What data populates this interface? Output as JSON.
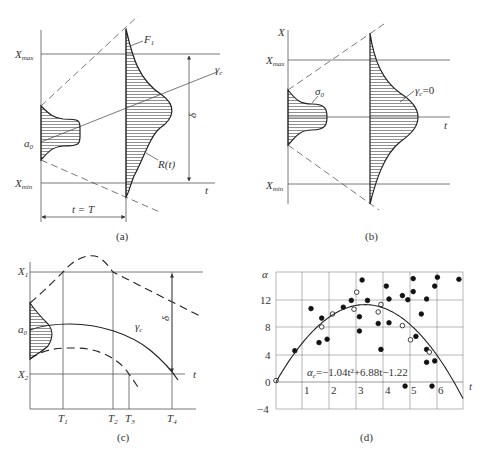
{
  "figure": {
    "panels": [
      {
        "id": "a",
        "caption": "(a)",
        "labels": {
          "x_max": "X",
          "x_max_sub": "max",
          "x_min": "X",
          "x_min_sub": "min",
          "a0": "a",
          "a0_sub": "0",
          "f1": "F",
          "f1_sub": "1",
          "gamma_c": "γ",
          "gamma_c_sub": "c",
          "r_t": "R(t)",
          "delta": "δ",
          "t_axis": "t",
          "interval": "t = T"
        }
      },
      {
        "id": "b",
        "caption": "(b)",
        "labels": {
          "x_axis": "X",
          "x_max": "X",
          "x_max_sub": "max",
          "x_min": "X",
          "x_min_sub": "min",
          "sigma0": "σ",
          "sigma0_sub": "0",
          "gamma_c": "γ",
          "gamma_c_sub": "c",
          "gamma_c_value": "=0",
          "t_axis": "t"
        }
      },
      {
        "id": "c",
        "caption": "(c)",
        "labels": {
          "x1": "X",
          "x1_sub": "1",
          "x2": "X",
          "x2_sub": "2",
          "a0": "a",
          "a0_sub": "0",
          "gamma_c": "γ",
          "gamma_c_sub": "c",
          "delta": "δ",
          "t_axis": "t",
          "t1": "T",
          "t1_sub": "1",
          "t2": "T",
          "t2_sub": "2",
          "t3": "T",
          "t3_sub": "3",
          "t4": "T",
          "t4_sub": "4"
        }
      },
      {
        "id": "d",
        "caption": "(d)",
        "labels": {
          "y_axis": "α",
          "t_axis": "t",
          "equation_lhs": "α",
          "equation_lhs_sub": "c",
          "equation_rhs": "=−1.04t²+6.88t−1.22"
        }
      }
    ]
  },
  "chart_data": {
    "type": "scatter",
    "title": "",
    "xlabel": "t",
    "ylabel": "α",
    "x_ticks": [
      "1",
      "2",
      "3",
      "4",
      "5",
      "6"
    ],
    "y_ticks": [
      "−4",
      "0",
      "4",
      "8",
      "12"
    ],
    "xlim": [
      0,
      7
    ],
    "ylim": [
      -4,
      16
    ],
    "grid": true,
    "fit": {
      "name": "α_c = −1.04t² + 6.88t − 1.22",
      "type": "curve",
      "coefficients": {
        "a": -1.04,
        "b": 6.88,
        "c": -1.22
      }
    },
    "series": [
      {
        "name": "filled points",
        "marker": "filled-circle",
        "points": [
          [
            0.7,
            4.6
          ],
          [
            1.3,
            10.8
          ],
          [
            1.6,
            5.8
          ],
          [
            1.7,
            9.4
          ],
          [
            1.9,
            6.3
          ],
          [
            2.5,
            11.0
          ],
          [
            2.8,
            12.0
          ],
          [
            3.1,
            9.6
          ],
          [
            3.1,
            7.5
          ],
          [
            3.2,
            15.0
          ],
          [
            3.4,
            12.0
          ],
          [
            3.8,
            8.6
          ],
          [
            3.9,
            4.8
          ],
          [
            4.1,
            14.1
          ],
          [
            4.2,
            12.2
          ],
          [
            4.2,
            8.7
          ],
          [
            4.7,
            12.7
          ],
          [
            4.8,
            -0.6
          ],
          [
            4.9,
            12.1
          ],
          [
            5.1,
            15.2
          ],
          [
            5.1,
            13.3
          ],
          [
            5.2,
            6.7
          ],
          [
            5.4,
            10.0
          ],
          [
            5.6,
            12.2
          ],
          [
            5.6,
            4.8
          ],
          [
            5.6,
            2.9
          ],
          [
            5.8,
            -0.6
          ],
          [
            5.9,
            14.1
          ],
          [
            5.9,
            3.1
          ],
          [
            6.0,
            15.4
          ],
          [
            6.8,
            15.1
          ]
        ]
      },
      {
        "name": "open points",
        "marker": "open-circle",
        "points": [
          [
            0.0,
            0.2
          ],
          [
            1.7,
            8.1
          ],
          [
            2.1,
            10.0
          ],
          [
            2.9,
            10.7
          ],
          [
            3.0,
            13.2
          ],
          [
            3.8,
            10.3
          ],
          [
            3.9,
            11.4
          ],
          [
            4.7,
            8.3
          ],
          [
            5.0,
            6.2
          ],
          [
            5.7,
            4.4
          ]
        ]
      }
    ]
  }
}
